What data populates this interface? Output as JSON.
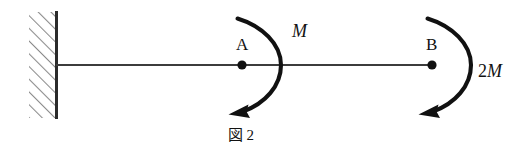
{
  "figure": {
    "caption_kanji": "図",
    "caption_number": "2",
    "background_color": "#ffffff",
    "ink_color": "#121212"
  },
  "support": {
    "type": "fixed-wall",
    "hatch_color": "#8a8a8a",
    "edge_color": "#2b2b2b"
  },
  "beam": {
    "color": "#3c3c3c",
    "label": ""
  },
  "points": [
    {
      "id": "A",
      "label": "A",
      "dot_color": "#111111"
    },
    {
      "id": "B",
      "label": "B",
      "dot_color": "#111111"
    }
  ],
  "moments": [
    {
      "at": "A",
      "coefficient": "",
      "symbol": "M",
      "label": "M",
      "direction": "counterclockwise",
      "arc_color": "#111111"
    },
    {
      "at": "B",
      "coefficient": "2",
      "symbol": "M",
      "label": "2M",
      "direction": "counterclockwise",
      "arc_color": "#111111"
    }
  ]
}
